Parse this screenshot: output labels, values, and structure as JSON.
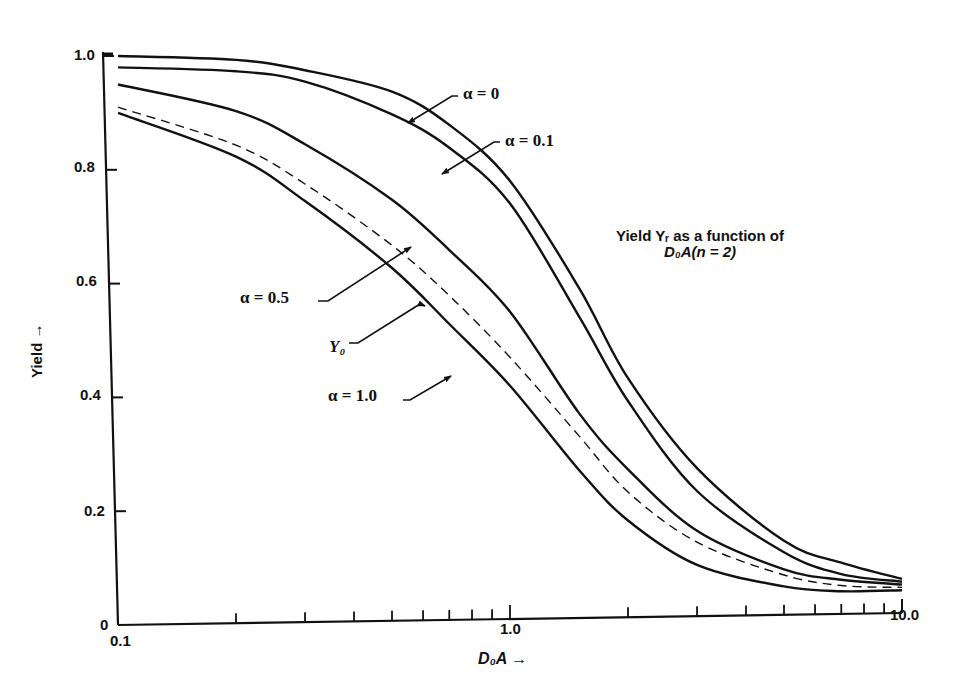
{
  "chart_data": {
    "type": "line",
    "title_lines": [
      "Yield Yᵣ as a function of",
      "D₀A(n = 2)"
    ],
    "xlabel": "D₀A →",
    "ylabel": "Yield →",
    "xscale": "log",
    "xlim": [
      0.1,
      10.0
    ],
    "ylim": [
      0,
      1.0
    ],
    "x_tick_labels": [
      "0.1",
      "1.0",
      "10.0"
    ],
    "y_tick_labels": [
      "0",
      "0.2",
      "0.4",
      "0.6",
      "0.8",
      "1.0"
    ],
    "y_ticks": [
      0,
      0.2,
      0.4,
      0.6,
      0.8,
      1.0
    ],
    "x_minor_ticks": [
      0.2,
      0.3,
      0.4,
      0.5,
      0.6,
      0.7,
      0.8,
      0.9,
      2,
      3,
      4,
      5,
      6,
      7,
      8,
      9
    ],
    "grid": false,
    "legend_position": "inline annotations with arrows",
    "x": [
      0.1,
      0.2,
      0.3,
      0.5,
      0.7,
      1.0,
      1.5,
      2.0,
      3.0,
      5.0,
      7.0,
      10.0
    ],
    "series": [
      {
        "name": "α = 0",
        "style": "solid",
        "values": [
          1.0,
          0.99,
          0.97,
          0.93,
          0.87,
          0.77,
          0.58,
          0.42,
          0.26,
          0.13,
          0.09,
          0.06
        ]
      },
      {
        "name": "α = 0.1",
        "style": "solid",
        "values": [
          0.98,
          0.97,
          0.95,
          0.89,
          0.83,
          0.73,
          0.53,
          0.38,
          0.22,
          0.11,
          0.07,
          0.055
        ]
      },
      {
        "name": "α = 0.5",
        "style": "solid",
        "values": [
          0.95,
          0.9,
          0.84,
          0.74,
          0.65,
          0.54,
          0.36,
          0.26,
          0.15,
          0.08,
          0.06,
          0.05
        ]
      },
      {
        "name": "Y₀",
        "style": "dashed",
        "values": [
          0.91,
          0.84,
          0.77,
          0.66,
          0.57,
          0.46,
          0.32,
          0.22,
          0.13,
          0.07,
          0.05,
          0.045
        ]
      },
      {
        "name": "α = 1.0",
        "style": "solid",
        "values": [
          0.9,
          0.82,
          0.74,
          0.62,
          0.52,
          0.41,
          0.26,
          0.17,
          0.09,
          0.05,
          0.04,
          0.04
        ]
      }
    ],
    "annotations": [
      {
        "text": "α = 0",
        "series": 0
      },
      {
        "text": "α = 0.1",
        "series": 1
      },
      {
        "text": "α = 0.5",
        "series": 2
      },
      {
        "text": "Y₀",
        "series": 3
      },
      {
        "text": "α = 1.0",
        "series": 4
      }
    ]
  },
  "labels": {
    "title_line1": "Yield Yᵣ as a function of",
    "title_line2": "D₀A(n = 2)",
    "xlabel": "D₀A →",
    "ylabel": "Yield →",
    "annot_a0": "α = 0",
    "annot_a01": "α = 0.1",
    "annot_a05": "α = 0.5",
    "annot_y0": "Y₀",
    "annot_a10": "α = 1.0"
  }
}
